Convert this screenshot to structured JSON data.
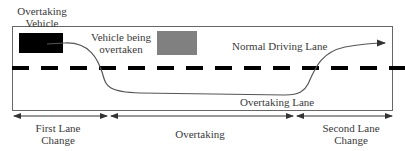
{
  "diagram": {
    "labels": {
      "overtaking_vehicle_line1": "Overtaking",
      "overtaking_vehicle_line2": "Vehicle",
      "vehicle_overtaken_line1": "Vehicle being",
      "vehicle_overtaken_line2": "overtaken",
      "normal_lane": "Normal Driving Lane",
      "overtaking_lane": "Overtaking Lane"
    },
    "phases": [
      {
        "line1": "First Lane",
        "line2": "Change"
      },
      {
        "line1": "Overtaking",
        "line2": ""
      },
      {
        "line1": "Second Lane",
        "line2": "Change"
      }
    ],
    "colors": {
      "overtaking_vehicle": "#000000",
      "vehicle_overtaken": "#808080",
      "road_border": "#555555",
      "lane_divider": "#000000",
      "trajectory": "#555555"
    }
  }
}
